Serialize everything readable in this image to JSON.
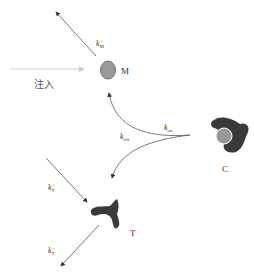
{
  "nodes": {
    "M": {
      "label": "M",
      "color": "#999999"
    },
    "C": {
      "label": "C"
    },
    "T": {
      "label": "T"
    }
  },
  "injection": {
    "label": "注入"
  },
  "rates": {
    "kM_minus": {
      "base": "k",
      "sub": "M",
      "sup": "−"
    },
    "kon": {
      "base": "k",
      "sub": "on"
    },
    "koff": {
      "base": "k",
      "sub": "off"
    },
    "kT_plus": {
      "base": "k",
      "sub": "T",
      "sup": "+"
    },
    "kT_minus": {
      "base": "k",
      "sub": "T",
      "sup": "−"
    }
  },
  "colors": {
    "receptor": "#3a3a3a",
    "arrow": "#555555",
    "injection_arrow": "#cccccc"
  }
}
